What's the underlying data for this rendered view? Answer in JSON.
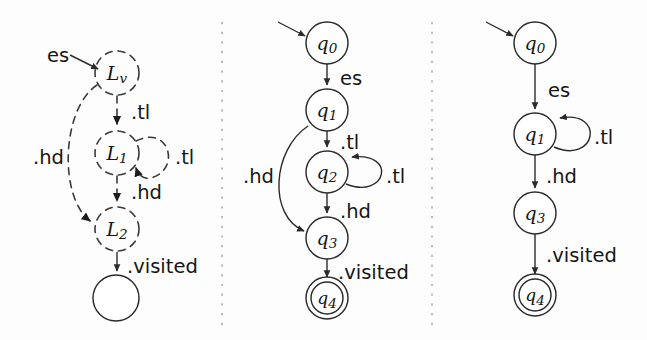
{
  "figure": {
    "background_color": "#fdfdfd",
    "ink_color": "#2b2b2b",
    "separator_color": "#9a9a9a",
    "width": 647,
    "height": 340,
    "panel_count": 3
  },
  "panels": [
    {
      "id": "panel-left",
      "name": "dashed-location-graph",
      "style": "dashed",
      "nodes": [
        {
          "id": "Lv",
          "base": "L",
          "sub": "v",
          "label": "Lv",
          "cx": 117,
          "cy": 73,
          "r": 22,
          "shape": "dashed-circle"
        },
        {
          "id": "L1",
          "base": "L",
          "sub": "1",
          "label": "L1",
          "cx": 117,
          "cy": 153,
          "r": 22,
          "shape": "dashed-circle"
        },
        {
          "id": "L2",
          "base": "L",
          "sub": "2",
          "label": "L2",
          "cx": 117,
          "cy": 229,
          "r": 22,
          "shape": "dashed-circle"
        },
        {
          "id": "Lend",
          "base": "",
          "sub": "",
          "label": "",
          "cx": 116,
          "cy": 298,
          "r": 23,
          "shape": "solid-circle"
        }
      ],
      "edges": [
        {
          "from": "start",
          "to": "Lv",
          "label": "es",
          "kind": "entry"
        },
        {
          "from": "Lv",
          "to": "L1",
          "label": ".tl",
          "kind": "dashed-straight"
        },
        {
          "from": "L1",
          "to": "L1",
          "label": ".tl",
          "kind": "dashed-self-loop"
        },
        {
          "from": "L1",
          "to": "L2",
          "label": ".hd",
          "kind": "dashed-straight"
        },
        {
          "from": "Lv",
          "to": "L2",
          "label": ".hd",
          "kind": "dashed-bypass"
        },
        {
          "from": "L2",
          "to": "Lend",
          "label": ".visited",
          "kind": "solid-straight"
        }
      ],
      "labels": [
        {
          "text": "es",
          "x": 47,
          "y": 55
        },
        {
          "text": ".tl",
          "x": 131,
          "y": 112
        },
        {
          "text": ".tl",
          "x": 175,
          "y": 157
        },
        {
          "text": ".hd",
          "x": 33,
          "y": 157
        },
        {
          "text": ".hd",
          "x": 131,
          "y": 192
        },
        {
          "text": ".visited",
          "x": 127,
          "y": 266
        }
      ]
    },
    {
      "id": "panel-middle",
      "name": "nfa-with-bypass",
      "style": "solid",
      "nodes": [
        {
          "id": "q0",
          "base": "q",
          "sub": "0",
          "label": "q0",
          "cx": 327,
          "cy": 43,
          "r": 21,
          "shape": "circle"
        },
        {
          "id": "q1",
          "base": "q",
          "sub": "1",
          "label": "q1",
          "cx": 327,
          "cy": 110,
          "r": 21,
          "shape": "circle"
        },
        {
          "id": "q2",
          "base": "q",
          "sub": "2",
          "label": "q2",
          "cx": 327,
          "cy": 172,
          "r": 21,
          "shape": "circle"
        },
        {
          "id": "q3",
          "base": "q",
          "sub": "3",
          "label": "q3",
          "cx": 327,
          "cy": 238,
          "r": 21,
          "shape": "circle"
        },
        {
          "id": "q4",
          "base": "q",
          "sub": "4",
          "label": "q4",
          "cx": 327,
          "cy": 298,
          "r": 17,
          "shape": "double-circle"
        }
      ],
      "edges": [
        {
          "from": "start",
          "to": "q0",
          "label": "",
          "kind": "entry"
        },
        {
          "from": "q0",
          "to": "q1",
          "label": "es",
          "kind": "straight"
        },
        {
          "from": "q1",
          "to": "q2",
          "label": ".tl",
          "kind": "straight"
        },
        {
          "from": "q2",
          "to": "q2",
          "label": ".tl",
          "kind": "self-loop"
        },
        {
          "from": "q2",
          "to": "q3",
          "label": ".hd",
          "kind": "straight"
        },
        {
          "from": "q1",
          "to": "q3",
          "label": ".hd",
          "kind": "bypass"
        },
        {
          "from": "q3",
          "to": "q4",
          "label": ".visited",
          "kind": "straight"
        }
      ],
      "labels": [
        {
          "text": "es",
          "x": 340,
          "y": 78
        },
        {
          "text": ".tl",
          "x": 340,
          "y": 142
        },
        {
          "text": ".tl",
          "x": 386,
          "y": 176
        },
        {
          "text": ".hd",
          "x": 243,
          "y": 176
        },
        {
          "text": ".hd",
          "x": 340,
          "y": 211
        },
        {
          "text": ".visited",
          "x": 338,
          "y": 272
        }
      ]
    },
    {
      "id": "panel-right",
      "name": "minimized-dfa",
      "style": "solid",
      "nodes": [
        {
          "id": "q0",
          "base": "q",
          "sub": "0",
          "label": "q0",
          "cx": 535,
          "cy": 43,
          "r": 21,
          "shape": "circle"
        },
        {
          "id": "q1",
          "base": "q",
          "sub": "1",
          "label": "q1",
          "cx": 535,
          "cy": 134,
          "r": 21,
          "shape": "circle"
        },
        {
          "id": "q3",
          "base": "q",
          "sub": "3",
          "label": "q3",
          "cx": 535,
          "cy": 213,
          "r": 21,
          "shape": "circle"
        },
        {
          "id": "q4",
          "base": "q",
          "sub": "4",
          "label": "q4",
          "cx": 535,
          "cy": 295,
          "r": 17,
          "shape": "double-circle"
        }
      ],
      "edges": [
        {
          "from": "start",
          "to": "q0",
          "label": "",
          "kind": "entry"
        },
        {
          "from": "q0",
          "to": "q1",
          "label": "es",
          "kind": "straight"
        },
        {
          "from": "q1",
          "to": "q1",
          "label": ".tl",
          "kind": "self-loop"
        },
        {
          "from": "q1",
          "to": "q3",
          "label": ".hd",
          "kind": "straight"
        },
        {
          "from": "q3",
          "to": "q4",
          "label": ".visited",
          "kind": "straight"
        }
      ],
      "labels": [
        {
          "text": "es",
          "x": 548,
          "y": 90
        },
        {
          "text": ".tl",
          "x": 594,
          "y": 137
        },
        {
          "text": ".hd",
          "x": 546,
          "y": 176
        },
        {
          "text": ".visited",
          "x": 546,
          "y": 255
        }
      ]
    }
  ],
  "separators": [
    {
      "id": "separator-1",
      "x": 222,
      "y1": 22,
      "y2": 326
    },
    {
      "id": "separator-2",
      "x": 432,
      "y1": 22,
      "y2": 326
    }
  ]
}
